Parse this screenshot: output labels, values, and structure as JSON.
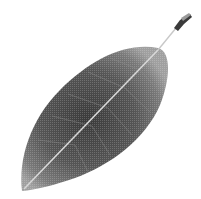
{
  "image": {
    "subject": "leaf",
    "description": "Grayscale photograph of a single elliptical leaf with visible midrib and veins, oriented diagonally with stem at upper right and tip at lower left",
    "colors": {
      "background": "#ffffff",
      "leaf_dark": "#3a3a3a",
      "leaf_mid": "#6e6e6e",
      "leaf_edge": "#9a9a9a",
      "midrib": "#d8d8d8",
      "stem": "#bdbdbd",
      "stem_tip": "#2a2a2a"
    }
  }
}
